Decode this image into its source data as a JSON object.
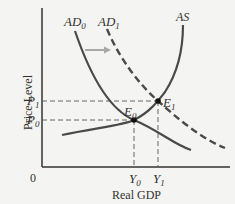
{
  "diagram": {
    "type": "AD-AS model",
    "y_axis_label": "Price Level",
    "x_axis_label": "Real GDP",
    "origin_label": "0",
    "curves": [
      {
        "id": "AD0",
        "label": "AD",
        "sub": "0",
        "style": "solid"
      },
      {
        "id": "AD1",
        "label": "AD",
        "sub": "1",
        "style": "dashed"
      },
      {
        "id": "AS",
        "label": "AS",
        "style": "solid"
      }
    ],
    "equilibria": [
      {
        "label": "E",
        "sub": "0",
        "price": {
          "label": "P",
          "sub": "0"
        },
        "output": {
          "label": "Y",
          "sub": "0"
        }
      },
      {
        "label": "E",
        "sub": "1",
        "price": {
          "label": "P",
          "sub": "1"
        },
        "output": {
          "label": "Y",
          "sub": "1"
        }
      }
    ],
    "shift_arrow": "rightward shift from AD0 to AD1",
    "colors": {
      "curve": "#4a4a4a",
      "arrow": "#a8a8a8",
      "guide": "#555555",
      "background": "#f4f4f2"
    }
  }
}
